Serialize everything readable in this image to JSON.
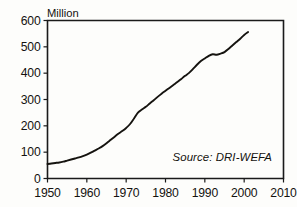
{
  "chart_data": {
    "type": "line",
    "title": "",
    "subtitle": "",
    "xlabel": "",
    "ylabel": "Million",
    "ylabel_position": "top-left-above-axis",
    "xlim": [
      1950,
      2010
    ],
    "ylim": [
      0,
      600
    ],
    "grid": false,
    "legend": null,
    "frame": "full-box",
    "x_ticks": [
      1950,
      1960,
      1970,
      1980,
      1990,
      2000,
      2010
    ],
    "x_tick_labels": [
      "1950",
      "1960",
      "1970",
      "1980",
      "1990",
      "2000",
      "2010"
    ],
    "y_ticks": [
      0,
      100,
      200,
      300,
      400,
      500,
      600
    ],
    "y_tick_labels": [
      "0",
      "100",
      "200",
      "300",
      "400",
      "500",
      "600"
    ],
    "series": [
      {
        "name": "value",
        "color": "#15130f",
        "x": [
          1950,
          1951,
          1952,
          1953,
          1954,
          1955,
          1956,
          1957,
          1958,
          1959,
          1960,
          1961,
          1962,
          1963,
          1964,
          1965,
          1966,
          1967,
          1968,
          1969,
          1970,
          1971,
          1972,
          1973,
          1974,
          1975,
          1976,
          1977,
          1978,
          1979,
          1980,
          1981,
          1982,
          1983,
          1984,
          1985,
          1986,
          1987,
          1988,
          1989,
          1990,
          1991,
          1992,
          1993,
          1994,
          1995,
          1996,
          1997,
          1998,
          1999,
          2000,
          2001
        ],
        "values": [
          55,
          57,
          59,
          61,
          64,
          68,
          72,
          76,
          80,
          85,
          91,
          98,
          106,
          114,
          123,
          134,
          146,
          158,
          170,
          180,
          192,
          207,
          228,
          250,
          262,
          272,
          285,
          297,
          310,
          322,
          333,
          344,
          355,
          366,
          378,
          390,
          401,
          416,
          432,
          446,
          456,
          466,
          472,
          470,
          474,
          480,
          492,
          505,
          518,
          531,
          545,
          556
        ]
      }
    ],
    "annotations": [
      {
        "name": "source-note",
        "text": "Source: DRI-WEFA",
        "style": "italic",
        "position": "bottom-right-inside-plot"
      }
    ]
  },
  "colors": {
    "line": "#15130f",
    "axis": "#1a1a1a",
    "text": "#14120f",
    "background": "#fdfdfb"
  }
}
